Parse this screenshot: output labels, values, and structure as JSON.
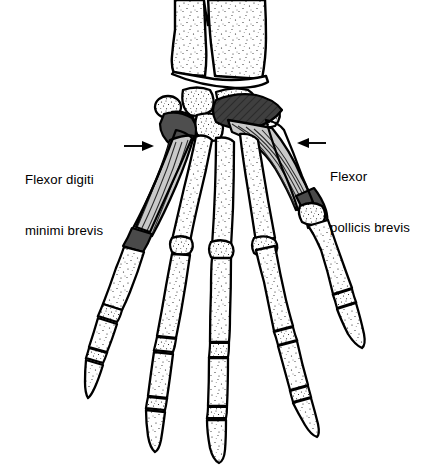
{
  "figure": {
    "view": "palmar view of right hand skeleton",
    "background_color": "#ffffff",
    "outline_color": "#000000",
    "bone_fill_color": "#ffffff",
    "stipple_color": "#1a1a1a",
    "muscle_belly_color": "#c9c9c9",
    "muscle_dark_color": "#4a4a4a",
    "muscle_origin_color": "#3a3a3a"
  },
  "labels": {
    "left": {
      "name": "flexor-digiti-minimi-brevis",
      "line1": "Flexor digiti",
      "line2": "minimi brevis",
      "full_text": "Flexor digiti minimi brevis",
      "leader_from_x": 130,
      "leader_to_x": 152,
      "leader_y": 146,
      "arrow_direction": "right"
    },
    "right": {
      "name": "flexor-pollicis-brevis",
      "line1": "Flexor",
      "line2": "pollicis brevis",
      "full_text": "Flexor pollicis brevis",
      "leader_from_x": 327,
      "leader_to_x": 299,
      "leader_y": 143,
      "arrow_direction": "left"
    }
  },
  "structures": {
    "forearm": [
      "radius",
      "ulna"
    ],
    "carpals": [
      "pisiform",
      "triquetrum",
      "lunate",
      "scaphoid",
      "hamate",
      "capitate",
      "trapezoid",
      "trapezium"
    ],
    "metacarpals": [
      "first",
      "second",
      "third",
      "fourth",
      "fifth"
    ],
    "digits": [
      "thumb",
      "index",
      "middle",
      "ring",
      "little"
    ],
    "muscles": [
      "flexor digiti minimi brevis",
      "flexor pollicis brevis"
    ]
  }
}
